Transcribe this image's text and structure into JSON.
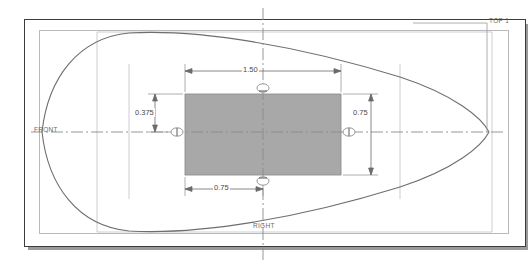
{
  "drawing": {
    "title": "CAD Sketch - Symmetric Airfoil Profile with Rectangular Section",
    "sheet": {
      "background_color": "#ffffff",
      "border_color": "#3c3c3c",
      "inner_border_color": "#b9b9b9",
      "shadow_color": "#9a9a96"
    },
    "shaded_rect": {
      "fill_color": "#a8a8a8",
      "stroke_color": "#8f8f8f",
      "width_label": "1.50",
      "height_label": "0.75"
    },
    "centerlines": {
      "color": "#808080",
      "horizontal_label": "FRONT",
      "vertical_label": "RIGHT"
    },
    "plane_labels": [
      {
        "name": "front-plane-label",
        "text": "FRONT"
      },
      {
        "name": "right-plane-label",
        "text": "RIGHT"
      },
      {
        "name": "top-plane-label",
        "text": "TOP 1"
      }
    ],
    "dimensions": [
      {
        "name": "overall-width",
        "value": "1.50",
        "orientation": "horizontal",
        "position": "top"
      },
      {
        "name": "half-height-upper",
        "value": "0.375",
        "orientation": "vertical",
        "position": "left"
      },
      {
        "name": "full-height",
        "value": "0.75",
        "orientation": "vertical",
        "position": "right"
      },
      {
        "name": "half-width",
        "value": "0.75",
        "orientation": "horizontal",
        "position": "bottom"
      }
    ],
    "profile": {
      "name": "airfoil-outline",
      "stroke_color": "#6e6e6e",
      "description": "Lens / airfoil shaped closed outline symmetric about both axes"
    },
    "construction_lines": {
      "color": "#bcbcbc",
      "count": 4
    }
  }
}
